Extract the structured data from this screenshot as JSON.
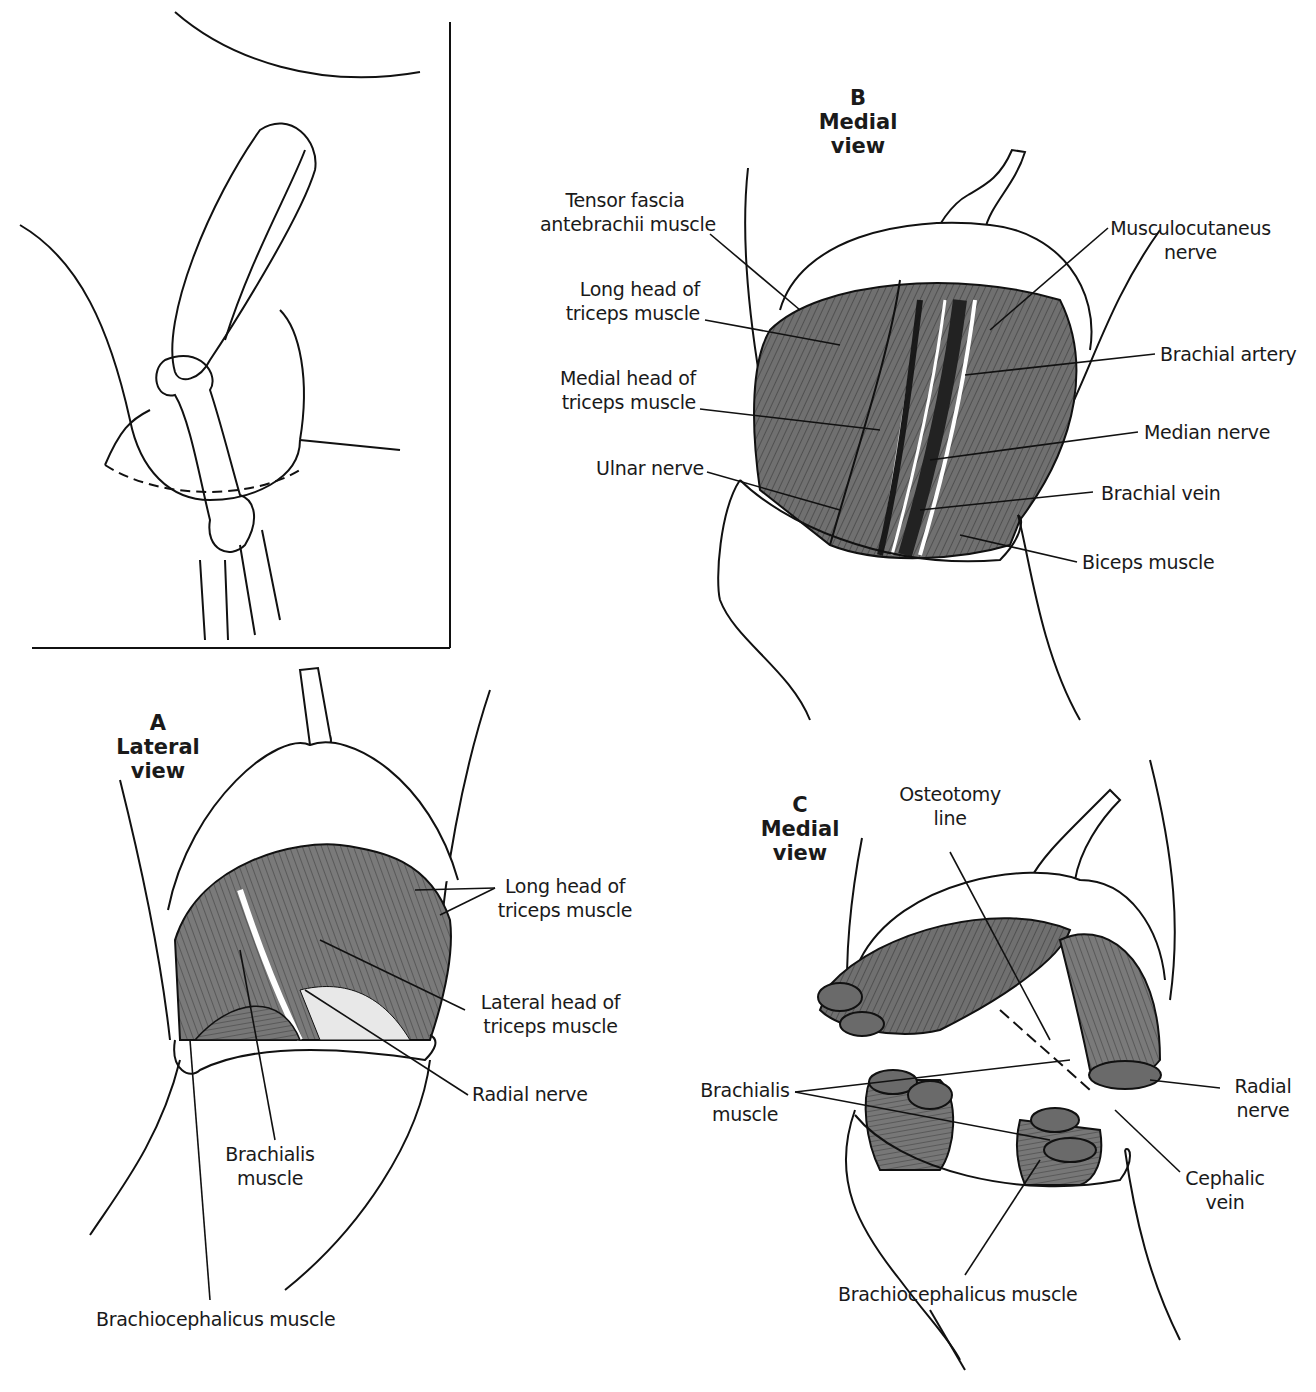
{
  "figure": {
    "panels": {
      "A": {
        "letter": "A",
        "title_line1": "Lateral",
        "title_line2": "view"
      },
      "B": {
        "letter": "B",
        "title_line1": "Medial",
        "title_line2": "view"
      },
      "C": {
        "letter": "C",
        "title_line1": "Medial",
        "title_line2": "view"
      }
    },
    "labels_B": {
      "tensor": [
        "Tensor fascia",
        "antebrachii muscle"
      ],
      "long_head": [
        "Long head of",
        "triceps muscle"
      ],
      "medial_head": [
        "Medial head of",
        "triceps muscle"
      ],
      "ulnar": [
        "Ulnar nerve"
      ],
      "musculocutaneus": [
        "Musculocutaneus",
        "nerve"
      ],
      "brachial_artery": [
        "Brachial artery"
      ],
      "median": [
        "Median nerve"
      ],
      "brachial_vein": [
        "Brachial vein"
      ],
      "biceps": [
        "Biceps muscle"
      ]
    },
    "labels_A": {
      "long_head": [
        "Long head of",
        "triceps muscle"
      ],
      "lateral_head": [
        "Lateral head of",
        "triceps muscle"
      ],
      "radial": [
        "Radial nerve"
      ],
      "brachialis": [
        "Brachialis",
        "muscle"
      ],
      "brachiocephalicus": [
        "Brachiocephalicus muscle"
      ]
    },
    "labels_C": {
      "osteotomy": [
        "Osteotomy",
        "line"
      ],
      "brachialis": [
        "Brachialis",
        "muscle"
      ],
      "radial": [
        "Radial",
        "nerve"
      ],
      "cephalic": [
        "Cephalic",
        "vein"
      ],
      "brachiocephalicus": [
        "Brachiocephalicus muscle"
      ]
    },
    "colors": {
      "muscle": "#6e6e6e",
      "muscle_dark": "#4a4a4a",
      "line": "#111111"
    }
  }
}
